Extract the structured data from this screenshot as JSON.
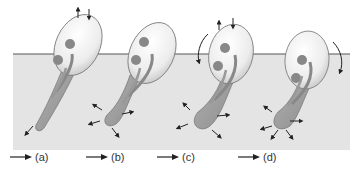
{
  "colors": {
    "substrate": "#e4e4e4",
    "surface_line": "#555555",
    "body_fill": "#f1f1f1",
    "body_stroke": "#6a6a6a",
    "organ_fill": "#8a8a8a",
    "foot_fill": "#9d9d9d",
    "arrow": "#222222"
  },
  "panels": [
    {
      "id": "a",
      "label": "(a)",
      "rotation_arrow": "none"
    },
    {
      "id": "b",
      "label": "(b)",
      "rotation_arrow": "none"
    },
    {
      "id": "c",
      "label": "(c)",
      "rotation_arrow": "counterclockwise"
    },
    {
      "id": "d",
      "label": "(d)",
      "rotation_arrow": "clockwise"
    }
  ]
}
